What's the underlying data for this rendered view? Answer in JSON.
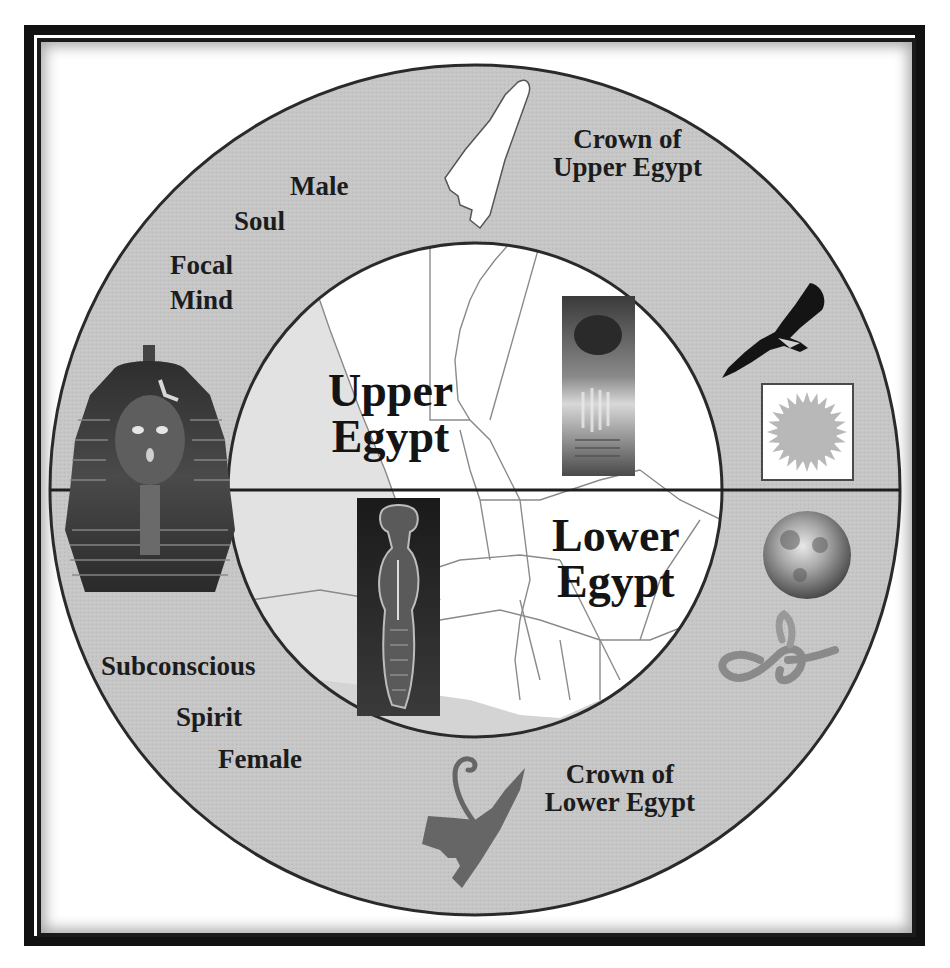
{
  "diagram": {
    "colors": {
      "frame": "#111111",
      "ring_fill": "#c4c4c4",
      "inner_fill": "#ffffff",
      "sea_fill": "#d0d0d0",
      "lines": "#2a2a2a",
      "text": "#1c1c1c",
      "red_crown": "#6a6a6a",
      "white_crown": "#ffffff",
      "sun": "#b0b0b0"
    },
    "upper_half": {
      "region_label_line1": "Upper",
      "region_label_line2": "Egypt",
      "crown_label_line1": "Crown of",
      "crown_label_line2": "Upper Egypt",
      "attributes": [
        "Male",
        "Soul",
        "Focal",
        "Mind"
      ],
      "symbols": [
        "white-crown",
        "vulture",
        "sun",
        "pharaoh-mask",
        "upper-coffin-image"
      ]
    },
    "lower_half": {
      "region_label_line1": "Lower",
      "region_label_line2": "Egypt",
      "crown_label_line1": "Crown of",
      "crown_label_line2": "Lower Egypt",
      "attributes": [
        "Subconscious",
        "Spirit",
        "Female"
      ],
      "symbols": [
        "red-crown",
        "moon",
        "cobra",
        "lower-coffin-image"
      ]
    }
  }
}
